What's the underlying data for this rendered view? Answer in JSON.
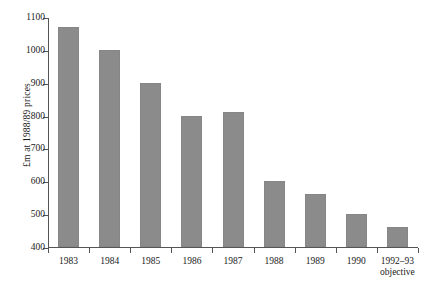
{
  "chart_data": {
    "type": "bar",
    "title": "",
    "subtitle": "",
    "xlabel": "",
    "ylabel": "£m at 1988/89 prices",
    "categories": [
      "1983",
      "1984",
      "1985",
      "1986",
      "1987",
      "1988",
      "1989",
      "1990",
      "1992–93\nobjective"
    ],
    "values": [
      1070,
      1000,
      900,
      800,
      812,
      600,
      560,
      500,
      460
    ],
    "ylim": [
      400,
      1100
    ],
    "ytick_labels": [
      "400",
      "500",
      "600",
      "700",
      "800",
      "900",
      "1000",
      "1100"
    ],
    "ytick_values": [
      400,
      500,
      600,
      700,
      800,
      900,
      1000,
      1100
    ],
    "grid": false,
    "legend": "none",
    "bar_color": "#8b8b8b",
    "axis_color": "#555555",
    "background_color": "#ffffff",
    "text_color": "#1a1a1a"
  }
}
